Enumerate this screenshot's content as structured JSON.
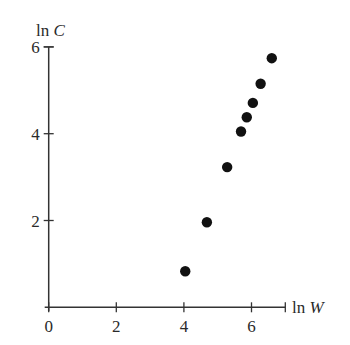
{
  "chart_data": {
    "type": "scatter",
    "title": "",
    "xlabel": "ln W",
    "ylabel": "ln C",
    "xlabel_parts": {
      "fn": "ln",
      "var": "W"
    },
    "ylabel_parts": {
      "fn": "ln",
      "var": "C"
    },
    "xlim": [
      0,
      7
    ],
    "ylim": [
      0,
      6
    ],
    "xticks": [
      0,
      2,
      4,
      6
    ],
    "yticks": [
      2,
      4,
      6
    ],
    "xtick_labels": [
      "0",
      "2",
      "4",
      "6"
    ],
    "ytick_labels": [
      "2",
      "4",
      "6"
    ],
    "grid": false,
    "legend": null,
    "points": [
      {
        "x": 4.04,
        "y": 0.83
      },
      {
        "x": 4.68,
        "y": 1.96
      },
      {
        "x": 5.28,
        "y": 3.23
      },
      {
        "x": 5.69,
        "y": 4.05
      },
      {
        "x": 5.86,
        "y": 4.38
      },
      {
        "x": 6.04,
        "y": 4.71
      },
      {
        "x": 6.27,
        "y": 5.15
      },
      {
        "x": 6.6,
        "y": 5.74
      }
    ],
    "marker_color": "#111111",
    "axis_color": "#333333"
  }
}
